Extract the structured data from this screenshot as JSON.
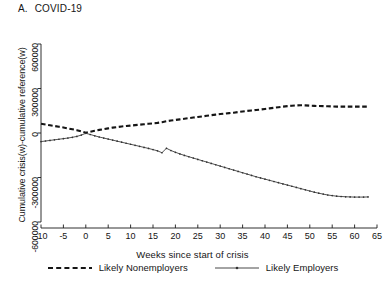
{
  "figure": {
    "panel_letter": "A.",
    "panel_title": "COVID-19",
    "background": "#ffffff",
    "ink": "#1a1a1a"
  },
  "chart_data": {
    "type": "line",
    "xlabel": "Weeks since start of crisis",
    "ylabel": "Cumulative crisis(w)-cumulative reference(w)",
    "xlim": [
      -10,
      65
    ],
    "ylim": [
      -600000,
      600000
    ],
    "xticks": [
      -10,
      -5,
      0,
      5,
      10,
      15,
      20,
      25,
      30,
      35,
      40,
      45,
      50,
      55,
      60,
      65
    ],
    "xtick_labels": [
      "-10",
      "-5",
      "0",
      "5",
      "10",
      "15",
      "20",
      "25",
      "30",
      "35",
      "40",
      "45",
      "50",
      "55",
      "60",
      "65"
    ],
    "yticks": [
      -600000,
      -300000,
      0,
      300000,
      600000
    ],
    "ytick_labels": [
      "-600000",
      "-300000",
      "0",
      "300000",
      "600000"
    ],
    "grid": false,
    "legend_position": "below",
    "x": [
      -10,
      -9,
      -8,
      -7,
      -6,
      -5,
      -4,
      -3,
      -2,
      -1,
      0,
      1,
      2,
      3,
      4,
      5,
      6,
      7,
      8,
      9,
      10,
      11,
      12,
      13,
      14,
      15,
      16,
      17,
      18,
      19,
      20,
      21,
      22,
      23,
      24,
      25,
      26,
      27,
      28,
      29,
      30,
      31,
      32,
      33,
      34,
      35,
      36,
      37,
      38,
      39,
      40,
      41,
      42,
      43,
      44,
      45,
      46,
      47,
      48,
      49,
      50,
      51,
      52,
      53,
      54,
      55,
      56,
      57,
      58,
      59,
      60,
      61,
      62,
      63
    ],
    "series": [
      {
        "name": "Likely Nonemployers",
        "style": "dashed",
        "color": "#151515",
        "values": [
          62000,
          57000,
          52000,
          47000,
          42000,
          37000,
          31000,
          25000,
          19000,
          11000,
          2000,
          8000,
          15000,
          21000,
          26000,
          31000,
          36000,
          40000,
          44000,
          47000,
          50000,
          53000,
          56000,
          59000,
          62000,
          65000,
          68000,
          73000,
          79000,
          84000,
          88000,
          92000,
          96000,
          100000,
          104000,
          108000,
          112000,
          116000,
          120000,
          124000,
          128000,
          131000,
          134000,
          137000,
          141000,
          145000,
          149000,
          152000,
          155000,
          158000,
          162000,
          166000,
          170000,
          174000,
          178000,
          181000,
          184000,
          186000,
          187000,
          186000,
          184000,
          183000,
          182000,
          181000,
          180000,
          179000,
          178000,
          178000,
          178000,
          178000,
          178000,
          178000,
          178000,
          178000
        ]
      },
      {
        "name": "Likely Employers",
        "style": "solid-thin-marker",
        "color": "#333333",
        "values": [
          -58000,
          -54000,
          -50000,
          -46000,
          -42000,
          -38000,
          -34000,
          -29000,
          -23000,
          -14000,
          -2000,
          -10000,
          -19000,
          -27000,
          -34000,
          -41000,
          -48000,
          -55000,
          -62000,
          -69000,
          -76000,
          -83000,
          -90000,
          -97000,
          -104000,
          -112000,
          -120000,
          -133000,
          -103000,
          -118000,
          -130000,
          -141000,
          -151000,
          -160000,
          -169000,
          -178000,
          -187000,
          -196000,
          -205000,
          -214000,
          -223000,
          -232000,
          -241000,
          -250000,
          -259000,
          -268000,
          -277000,
          -286000,
          -295000,
          -303000,
          -311000,
          -319000,
          -327000,
          -335000,
          -343000,
          -351000,
          -359000,
          -367000,
          -375000,
          -383000,
          -391000,
          -399000,
          -406000,
          -412000,
          -418000,
          -422000,
          -426000,
          -428000,
          -430000,
          -431000,
          -432000,
          -432000,
          -432000,
          -431000
        ]
      }
    ],
    "legend": [
      {
        "label": "Likely Nonemployers",
        "style": "dashed"
      },
      {
        "label": "Likely Employers",
        "style": "solid-thin-marker"
      }
    ]
  }
}
